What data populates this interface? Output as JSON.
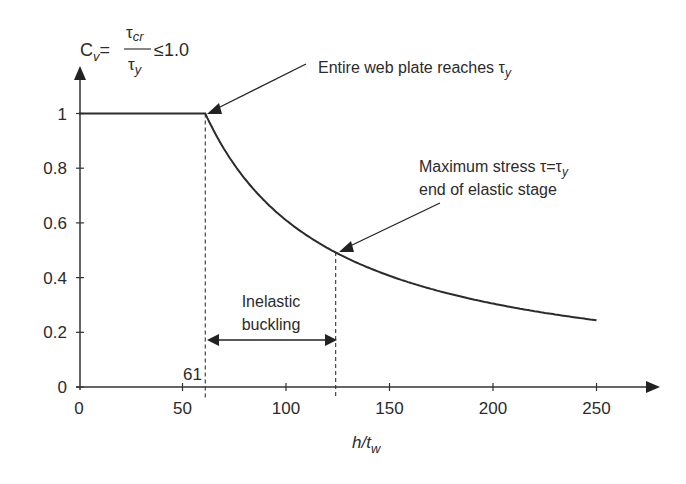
{
  "chart_data": {
    "type": "line",
    "title": "",
    "formula": {
      "lhs": "C",
      "lhs_sub": "v",
      "eq": "=",
      "numerator": "τ",
      "numerator_sub": "cr",
      "denominator": "τ",
      "denominator_sub": "y",
      "rhs": "≤1.0"
    },
    "xlabel": {
      "main": "h/t",
      "sub": "w"
    },
    "ylabel": "C_v",
    "xlim": [
      0,
      280
    ],
    "ylim": [
      0,
      1.2
    ],
    "x_ticks": [
      "0",
      "50",
      "100",
      "150",
      "200",
      "250"
    ],
    "x_tick_values": [
      0,
      50,
      100,
      150,
      200,
      250
    ],
    "y_ticks": [
      "0",
      "0.2",
      "0.4",
      "0.6",
      "0.8",
      "1"
    ],
    "y_tick_values": [
      0,
      0.2,
      0.4,
      0.6,
      0.8,
      1.0
    ],
    "grid": false,
    "series": [
      {
        "name": "C_v",
        "x": [
          0,
          61,
          70,
          80,
          90,
          100,
          110,
          124,
          140,
          160,
          180,
          200,
          220,
          250
        ],
        "y": [
          1.0,
          1.0,
          0.871,
          0.763,
          0.678,
          0.61,
          0.555,
          0.492,
          0.436,
          0.381,
          0.339,
          0.305,
          0.277,
          0.244
        ]
      }
    ],
    "markers": [
      {
        "x": 61,
        "label": "61",
        "style": "dashed-vertical"
      },
      {
        "x": 124,
        "style": "dashed-vertical"
      }
    ],
    "annotations": [
      {
        "text": "Entire web plate reaches ",
        "symbol": "τ",
        "symbol_sub": "y",
        "points_to": [
          61,
          1.0
        ]
      },
      {
        "text_line1": "Maximum stress ",
        "symbol_line1": "τ=τ",
        "symbol_sub": "y",
        "text_line2": "end of elastic stage",
        "points_to": [
          124,
          0.49
        ]
      },
      {
        "text_line1": "Inelastic",
        "text_line2": "buckling",
        "range": [
          61,
          124
        ],
        "style": "double-arrow"
      }
    ]
  }
}
